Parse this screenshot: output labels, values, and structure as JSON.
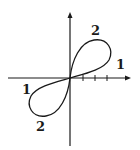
{
  "diagram": {
    "type": "polar-curve-sketch",
    "stroke_color": "#1a1a1a",
    "labels": {
      "upper_top": "2",
      "upper_right": "1",
      "lower_left": "1",
      "lower_bottom": "2"
    },
    "x_axis_ticks": 3
  }
}
